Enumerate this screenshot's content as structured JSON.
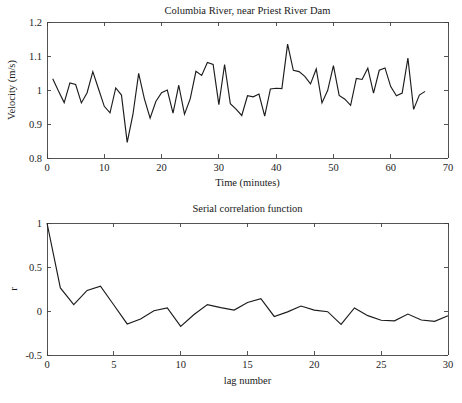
{
  "figure": {
    "background": "#ffffff",
    "line_color": "#1c1c1c",
    "axis_color": "#404040",
    "text_color": "#1a1a1a"
  },
  "chart_data": [
    {
      "type": "line",
      "id": "velocity-timeseries",
      "title": "Columbia River, near Priest River Dam",
      "xlabel": "Time (minutes)",
      "ylabel": "Velocity (m/s)",
      "xlim": [
        0,
        70
      ],
      "ylim": [
        0.8,
        1.2
      ],
      "xticks": [
        0,
        10,
        20,
        30,
        40,
        50,
        60,
        70
      ],
      "xticklabels": [
        "0",
        "10",
        "20",
        "30",
        "40",
        "50",
        "60",
        "70"
      ],
      "yticks": [
        0.8,
        0.9,
        1.0,
        1.1,
        1.2
      ],
      "yticklabels": [
        "0.8",
        "0.9",
        "1",
        "1.1",
        "1.2"
      ],
      "grid": false,
      "legend": null,
      "x": [
        1,
        2,
        3,
        4,
        5,
        6,
        7,
        8,
        9,
        10,
        11,
        12,
        13,
        14,
        15,
        16,
        17,
        18,
        19,
        20,
        21,
        22,
        23,
        24,
        25,
        26,
        27,
        28,
        29,
        30,
        31,
        32,
        33,
        34,
        35,
        36,
        37,
        38,
        39,
        40,
        41,
        42,
        43,
        44,
        45,
        46,
        47,
        48,
        49,
        50,
        51,
        52,
        53,
        54,
        55,
        56,
        57,
        58,
        59,
        60,
        61,
        62,
        63,
        64,
        65,
        66
      ],
      "values": [
        1.033,
        0.997,
        0.963,
        1.021,
        1.016,
        0.962,
        0.992,
        1.054,
        1.003,
        0.952,
        0.933,
        1.006,
        0.985,
        0.846,
        0.928,
        1.049,
        0.974,
        0.917,
        0.966,
        0.992,
        1.0,
        0.932,
        1.014,
        0.929,
        0.974,
        1.055,
        1.043,
        1.081,
        1.075,
        0.957,
        1.075,
        0.96,
        0.944,
        0.925,
        0.983,
        0.98,
        0.988,
        0.923,
        1.003,
        1.005,
        1.004,
        1.135,
        1.058,
        1.054,
        1.04,
        1.018,
        1.062,
        0.962,
        0.999,
        1.072,
        0.984,
        0.973,
        0.955,
        1.034,
        1.031,
        1.064,
        0.991,
        1.058,
        1.065,
        1.01,
        0.983,
        0.991,
        1.094,
        0.943,
        0.985,
        0.996
      ]
    },
    {
      "type": "line",
      "id": "serial-correlation",
      "title": "Serial correlation function",
      "xlabel": "lag number",
      "ylabel": "r",
      "xlim": [
        0,
        30
      ],
      "ylim": [
        -0.5,
        1.0
      ],
      "xticks": [
        0,
        5,
        10,
        15,
        20,
        25,
        30
      ],
      "xticklabels": [
        "0",
        "5",
        "10",
        "15",
        "20",
        "25",
        "30"
      ],
      "yticks": [
        -0.5,
        0,
        0.5,
        1.0
      ],
      "yticklabels": [
        "-0.5",
        "0",
        "0.5",
        "1"
      ],
      "grid": false,
      "legend": null,
      "x": [
        0,
        1,
        2,
        3,
        4,
        5,
        6,
        7,
        8,
        9,
        10,
        11,
        12,
        13,
        14,
        15,
        16,
        17,
        18,
        19,
        20,
        21,
        22,
        23,
        24,
        25,
        26,
        27,
        28,
        29,
        30
      ],
      "values": [
        1.0,
        0.262,
        0.072,
        0.234,
        0.283,
        0.068,
        -0.147,
        -0.092,
        0.003,
        0.036,
        -0.175,
        -0.04,
        0.072,
        0.038,
        0.01,
        0.096,
        0.14,
        -0.062,
        -0.01,
        0.056,
        0.01,
        -0.008,
        -0.152,
        0.035,
        -0.053,
        -0.105,
        -0.112,
        -0.035,
        -0.102,
        -0.118,
        -0.055
      ]
    }
  ]
}
